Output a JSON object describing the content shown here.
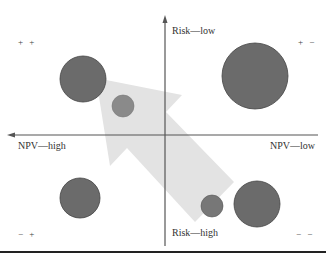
{
  "axes": {
    "y_top": "Risk—low",
    "y_bottom": "Risk—high",
    "x_left": "NPV—high",
    "x_right": "NPV—low"
  },
  "quadrants": {
    "top_left": "+ +",
    "top_right": "+ −",
    "bottom_left": "− +",
    "bottom_right": "− −"
  },
  "colors": {
    "bubble": "#6b6b6b",
    "bubble_small": "#8a8a8a",
    "arrow": "#e3e3e3",
    "axis": "#555555"
  },
  "bubbles": [
    {
      "quadrant": "top_left",
      "cx": 83,
      "cy": 79,
      "r": 23
    },
    {
      "quadrant": "top_left",
      "cx": 123,
      "cy": 106,
      "r": 11
    },
    {
      "quadrant": "top_right",
      "cx": 255,
      "cy": 76,
      "r": 33
    },
    {
      "quadrant": "bottom_left",
      "cx": 80,
      "cy": 198,
      "r": 20
    },
    {
      "quadrant": "bottom_right",
      "cx": 212,
      "cy": 206,
      "r": 11
    },
    {
      "quadrant": "bottom_right",
      "cx": 257,
      "cy": 204,
      "r": 23
    }
  ]
}
